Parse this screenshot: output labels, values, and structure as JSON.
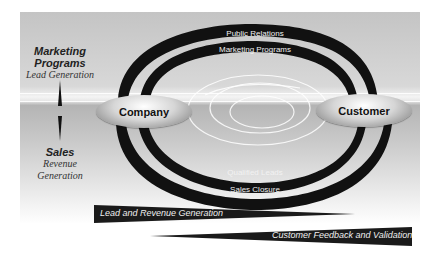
{
  "left_column": {
    "marketing": {
      "title_line1": "Marketing",
      "title_line2": "Programs",
      "subtitle": "Lead Generation"
    },
    "sales": {
      "title": "Sales",
      "subtitle_line1": "Revenue",
      "subtitle_line2": "Generation"
    }
  },
  "nodes": {
    "company": "Company",
    "customer": "Customer"
  },
  "arcs": {
    "top_outer": "Public Relations",
    "top_inner": "Marketing Programs",
    "bottom_inner": "Qualified Leads",
    "bottom_outer": "Sales Closure"
  },
  "banners": {
    "forward": "Lead and Revenue Generation",
    "feedback": "Customer Feedback and Validation"
  },
  "colors": {
    "arc_fill": "#111111",
    "banner_fill": "#1a1a1a",
    "panel_gray": "#c4c4c4"
  }
}
